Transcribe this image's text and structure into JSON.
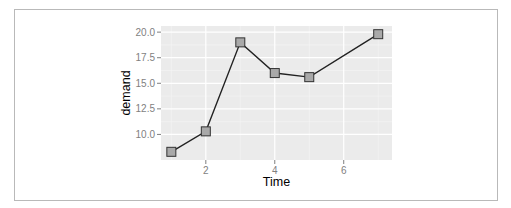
{
  "chart_data": {
    "type": "line",
    "title": "",
    "xlabel": "Time",
    "ylabel": "demand",
    "x": [
      1,
      2,
      3,
      4,
      5,
      7
    ],
    "series": [
      {
        "name": "demand",
        "values": [
          8.3,
          10.3,
          19.0,
          16.0,
          15.6,
          19.8
        ]
      }
    ],
    "xticks": [
      2,
      4,
      6
    ],
    "xtick_labels": [
      "2",
      "4",
      "6"
    ],
    "yticks": [
      10.0,
      12.5,
      15.0,
      17.5,
      20.0
    ],
    "ytick_labels": [
      "10.0",
      "12.5",
      "15.0",
      "17.5",
      "20.0"
    ],
    "xlim": [
      0.7,
      7.4
    ],
    "ylim": [
      7.5,
      20.6
    ],
    "grid": true,
    "legend": "none",
    "marker": "square",
    "colors": {
      "panel": "#ebebeb",
      "grid": "#ffffff",
      "line": "#222222",
      "marker_fill": "#a9a9a9",
      "marker_edge": "#333333",
      "tick_text": "#7f7f7f"
    }
  }
}
